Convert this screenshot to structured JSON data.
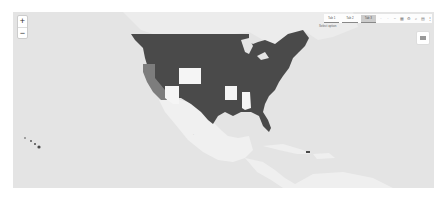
{
  "map": {
    "type": "choropleth",
    "region": "United States",
    "colors": {
      "ocean": "#e4e4e4",
      "land": "#f2f2f2",
      "canada": "#ededed",
      "mexico": "#f0f0f0",
      "state_dark": "#4a4a4a",
      "state_medium": "#7d7d7d",
      "state_light": "#f5f5f5"
    },
    "states": [
      {
        "name": "California",
        "shade": "medium"
      },
      {
        "name": "Colorado",
        "shade": "light"
      },
      {
        "name": "Arizona",
        "shade": "light"
      },
      {
        "name": "Arkansas",
        "shade": "light"
      },
      {
        "name": "Alabama",
        "shade": "light"
      },
      {
        "name": "Other states",
        "shade": "dark"
      },
      {
        "name": "Hawaii",
        "shade": "dark"
      },
      {
        "name": "Puerto Rico",
        "shade": "dark"
      }
    ]
  },
  "controls": {
    "zoom_in": "+",
    "zoom_out": "−"
  },
  "toolbar": {
    "segments": [
      "Tab 1",
      "Tab 2",
      "Tab 3"
    ],
    "active_segment": 2,
    "icons": [
      "pan-icon",
      "zoom-icon",
      "minus-icon",
      "grid-icon",
      "gear-icon",
      "search-icon",
      "download-icon",
      "more-icon"
    ],
    "dropdown_label": "Select option"
  }
}
